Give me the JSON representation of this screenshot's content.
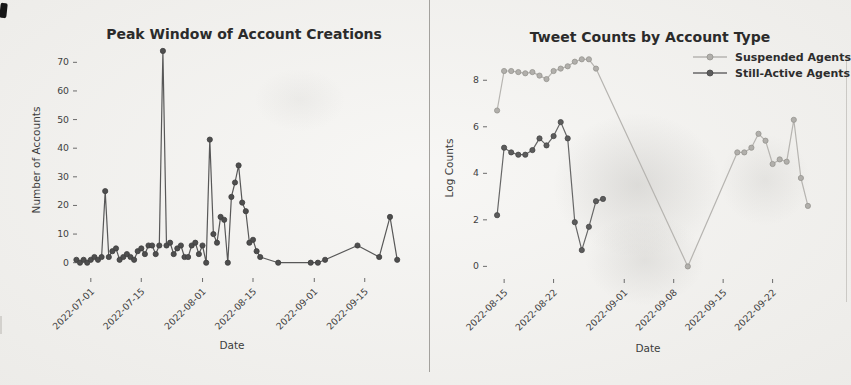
{
  "page": {
    "background_color": "#f3f2ef",
    "divider_color": "#a3a19d",
    "corner_mark_color": "#161616"
  },
  "chart_data": [
    {
      "type": "line",
      "title": "Peak Window of Account Creations",
      "xlabel": "Date",
      "ylabel": "Number of Accounts",
      "xlim": [
        "2022-06-28",
        "2022-09-27"
      ],
      "ylim": [
        -5,
        75
      ],
      "yticks": [
        0,
        10,
        20,
        30,
        40,
        50,
        60,
        70
      ],
      "xticks": [
        "2022-07-01",
        "2022-07-15",
        "2022-08-01",
        "2022-08-15",
        "2022-09-01",
        "2022-09-15"
      ],
      "grid": false,
      "legend_position": "none",
      "series": [
        {
          "name": "Account Creations",
          "color": "#585858",
          "marker_color": "#4e4e4e",
          "marker_edge": "#3f3f3f",
          "x": [
            "2022-06-27",
            "2022-06-28",
            "2022-06-29",
            "2022-06-30",
            "2022-07-01",
            "2022-07-02",
            "2022-07-03",
            "2022-07-04",
            "2022-07-05",
            "2022-07-06",
            "2022-07-07",
            "2022-07-08",
            "2022-07-09",
            "2022-07-10",
            "2022-07-11",
            "2022-07-12",
            "2022-07-13",
            "2022-07-14",
            "2022-07-15",
            "2022-07-16",
            "2022-07-17",
            "2022-07-18",
            "2022-07-19",
            "2022-07-20",
            "2022-07-21",
            "2022-07-22",
            "2022-07-23",
            "2022-07-24",
            "2022-07-25",
            "2022-07-26",
            "2022-07-27",
            "2022-07-28",
            "2022-07-29",
            "2022-07-30",
            "2022-07-31",
            "2022-08-01",
            "2022-08-02",
            "2022-08-03",
            "2022-08-04",
            "2022-08-05",
            "2022-08-06",
            "2022-08-07",
            "2022-08-08",
            "2022-08-09",
            "2022-08-10",
            "2022-08-11",
            "2022-08-12",
            "2022-08-13",
            "2022-08-14",
            "2022-08-15",
            "2022-08-16",
            "2022-08-17",
            "2022-08-22",
            "2022-08-31",
            "2022-09-02",
            "2022-09-04",
            "2022-09-13",
            "2022-09-19",
            "2022-09-22",
            "2022-09-24"
          ],
          "y": [
            1,
            0,
            1,
            0,
            1,
            2,
            1,
            2,
            25,
            2,
            4,
            5,
            1,
            2,
            3,
            2,
            1,
            4,
            5,
            3,
            6,
            6,
            3,
            6,
            74,
            6,
            7,
            3,
            5,
            6,
            2,
            2,
            6,
            7,
            3,
            6,
            0,
            43,
            10,
            7,
            16,
            15,
            0,
            23,
            28,
            34,
            21,
            18,
            7,
            8,
            4,
            2,
            0,
            0,
            0,
            1,
            6,
            2,
            16,
            1
          ]
        }
      ]
    },
    {
      "type": "line",
      "title": "Tweet Counts by Account Type",
      "xlabel": "Date",
      "ylabel": "Log Counts",
      "xlim": [
        "2022-08-13",
        "2022-09-28"
      ],
      "ylim": [
        -0.5,
        9.0
      ],
      "yticks": [
        0,
        2,
        4,
        6,
        8
      ],
      "xticks": [
        "2022-08-15",
        "2022-08-22",
        "2022-09-01",
        "2022-09-08",
        "2022-09-15",
        "2022-09-22"
      ],
      "grid": false,
      "legend_position": "upper right",
      "series": [
        {
          "name": "Suspended Agents",
          "color": "#b6b4b0",
          "marker_color": "#b1afab",
          "marker_edge": "#96948f",
          "x": [
            "2022-08-14",
            "2022-08-15",
            "2022-08-16",
            "2022-08-17",
            "2022-08-18",
            "2022-08-19",
            "2022-08-20",
            "2022-08-21",
            "2022-08-22",
            "2022-08-23",
            "2022-08-24",
            "2022-08-25",
            "2022-08-26",
            "2022-08-27",
            "2022-08-28",
            "2022-09-10",
            "2022-09-17",
            "2022-09-18",
            "2022-09-19",
            "2022-09-20",
            "2022-09-21",
            "2022-09-22",
            "2022-09-23",
            "2022-09-24",
            "2022-09-25",
            "2022-09-26",
            "2022-09-27"
          ],
          "y": [
            6.7,
            8.4,
            8.4,
            8.35,
            8.3,
            8.35,
            8.2,
            8.05,
            8.4,
            8.5,
            8.6,
            8.8,
            8.9,
            8.9,
            8.5,
            0.0,
            4.9,
            4.9,
            5.1,
            5.7,
            5.4,
            4.4,
            4.6,
            4.5,
            6.3,
            3.8,
            2.6
          ]
        },
        {
          "name": "Still-Active Agents",
          "color": "#676767",
          "marker_color": "#5c5c5c",
          "marker_edge": "#474747",
          "x": [
            "2022-08-14",
            "2022-08-15",
            "2022-08-16",
            "2022-08-17",
            "2022-08-18",
            "2022-08-19",
            "2022-08-20",
            "2022-08-21",
            "2022-08-22",
            "2022-08-23",
            "2022-08-24",
            "2022-08-25",
            "2022-08-26",
            "2022-08-27",
            "2022-08-28",
            "2022-08-29"
          ],
          "y": [
            2.2,
            5.1,
            4.9,
            4.8,
            4.8,
            5.0,
            5.5,
            5.2,
            5.6,
            6.2,
            5.5,
            1.9,
            0.7,
            1.7,
            2.8,
            2.9
          ]
        }
      ]
    }
  ]
}
